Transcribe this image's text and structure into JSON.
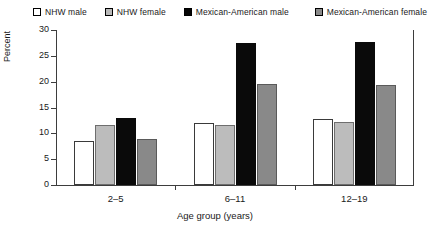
{
  "chart_data": {
    "type": "bar",
    "title": "",
    "xlabel": "Age group (years)",
    "ylabel": "Percent",
    "categories": [
      "2–5",
      "6–11",
      "12–19"
    ],
    "series": [
      {
        "name": "NHW male",
        "swatch": "open",
        "color": "#ffffff",
        "values": [
          8.6,
          12.0,
          12.7
        ]
      },
      {
        "name": "NHW female",
        "swatch": "light",
        "color": "#bcbcbc",
        "values": [
          11.6,
          11.6,
          12.2
        ]
      },
      {
        "name": "Mexican-American male",
        "swatch": "black",
        "color": "#0a0a0a",
        "values": [
          13.0,
          27.5,
          27.7
        ]
      },
      {
        "name": "Mexican-American female",
        "swatch": "mid",
        "color": "#898989",
        "values": [
          9.0,
          19.5,
          19.3
        ]
      }
    ],
    "ylim": [
      0,
      30
    ],
    "yticks": [
      0,
      5,
      10,
      15,
      20,
      25,
      30
    ],
    "ytick_labels": [
      "0",
      "5",
      "10",
      "15",
      "20",
      "25",
      "30"
    ],
    "grid": false,
    "legend_position": "top"
  },
  "legend": {
    "items": [
      {
        "label": "NHW male"
      },
      {
        "label": "NHW female"
      },
      {
        "label": "Mexican-American male"
      },
      {
        "label": "Mexican-American female"
      }
    ]
  },
  "axes": {
    "y_title": "Percent",
    "x_title": "Age group (years)",
    "y_labels": [
      "30",
      "25",
      "20",
      "15",
      "10",
      "5",
      "0"
    ],
    "x_labels": [
      "2–5",
      "6–11",
      "12–19"
    ]
  }
}
